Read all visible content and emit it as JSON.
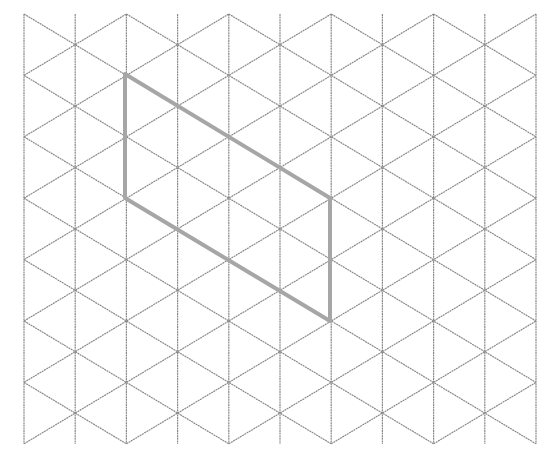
{
  "diagram": {
    "type": "isometric-triangle-grid",
    "background": "#ffffff",
    "grid": {
      "color": "#8a8a8a",
      "stroke_width": 1.2,
      "x0": 24,
      "dx": 51.2,
      "columns": 11,
      "y0": 14,
      "dy": 30.7,
      "rows": 15
    },
    "shape": {
      "name": "parallelogram",
      "color": "#a6a6a6",
      "stroke_width": 4,
      "vertices": [
        [
          125,
          74
        ],
        [
          330,
          198
        ],
        [
          330,
          321
        ],
        [
          125,
          198
        ]
      ]
    }
  }
}
